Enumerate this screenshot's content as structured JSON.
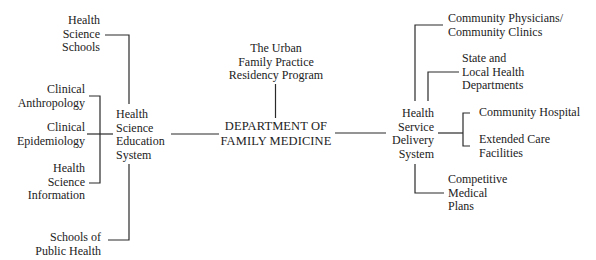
{
  "center": {
    "lines": [
      "DEPARTMENT OF",
      "FAMILY MEDICINE"
    ]
  },
  "top": {
    "lines": [
      "The Urban",
      "Family Practice",
      "Residency Program"
    ]
  },
  "left_hub": {
    "lines": [
      "Health",
      "Science",
      "Education",
      "System"
    ]
  },
  "left_children": [
    {
      "lines": [
        "Health",
        "Science",
        "Schools"
      ]
    },
    {
      "lines": [
        "Clinical",
        "Anthropology"
      ]
    },
    {
      "lines": [
        "Clinical",
        "Epidemiology"
      ]
    },
    {
      "lines": [
        "Health",
        "Science",
        "Information"
      ]
    },
    {
      "lines": [
        "Schools of",
        "Public Health"
      ]
    }
  ],
  "right_hub": {
    "lines": [
      "Health",
      "Service",
      "Delivery",
      "System"
    ]
  },
  "right_children": [
    {
      "lines": [
        "Community Physicians/",
        "Community Clinics"
      ]
    },
    {
      "lines": [
        "State and",
        "Local Health",
        "Departments"
      ]
    },
    {
      "lines": [
        "Community Hospital"
      ]
    },
    {
      "lines": [
        "Extended Care",
        "Facilities"
      ]
    },
    {
      "lines": [
        "Competitive",
        "Medical",
        "Plans"
      ]
    }
  ]
}
